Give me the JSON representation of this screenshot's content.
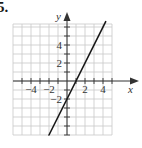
{
  "problem": {
    "number": "5."
  },
  "chart_data": {
    "type": "line",
    "title": "",
    "xlabel": "x",
    "ylabel": "y",
    "xlim": [
      -6,
      5
    ],
    "ylim": [
      -6,
      6
    ],
    "grid": true,
    "x_tick_labels": [
      "−4",
      "−2",
      "2",
      "4"
    ],
    "x_tick_values": [
      -4,
      -2,
      2,
      4
    ],
    "y_tick_labels": [
      "4",
      "2",
      "−2"
    ],
    "y_tick_values": [
      4,
      2,
      -2
    ],
    "series": [
      {
        "name": "line",
        "equation": "y = 2x - 2",
        "slope": 2,
        "intercept": -2,
        "x": [
          -2,
          4.3
        ],
        "y": [
          -6,
          6.6
        ]
      }
    ]
  }
}
